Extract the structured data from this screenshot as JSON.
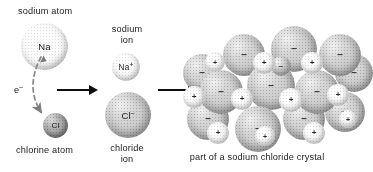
{
  "figure": {
    "type": "chemistry-process-diagram"
  },
  "labels": {
    "sodium_atom": "sodium atom",
    "chlorine_atom": "chlorine atom",
    "sodium_ion_line1": "sodium",
    "sodium_ion_line2": "ion",
    "chloride_ion_line1": "chloride",
    "chloride_ion_line2": "ion",
    "crystal_caption": "part of a sodium chloride crystal",
    "electron": "e",
    "electron_charge": "–"
  },
  "species": {
    "na_atom": {
      "symbol": "Na",
      "charge": "",
      "shade": "light"
    },
    "cl_atom": {
      "symbol": "Cl",
      "charge": "",
      "shade": "dark"
    },
    "na_ion": {
      "symbol": "Na",
      "charge": "+",
      "shade": "light"
    },
    "cl_ion": {
      "symbol": "Cl",
      "charge": "–",
      "shade": "mid"
    }
  },
  "arrows": {
    "arrow1_name": "reaction-arrow-1",
    "arrow2_name": "reaction-arrow-2",
    "electron_arrow_name": "electron-transfer-arrow"
  },
  "crystal": {
    "anion_glyph": "–",
    "cation_glyph": "+",
    "anion_count": 13,
    "cation_count": 11,
    "anions": [
      {
        "x": 40,
        "y": 8,
        "d": 42,
        "z": 1
      },
      {
        "x": 88,
        "y": 0,
        "d": 46,
        "z": 1
      },
      {
        "x": 136,
        "y": 8,
        "d": 42,
        "z": 1
      },
      {
        "x": 16,
        "y": 44,
        "d": 44,
        "z": 3
      },
      {
        "x": 64,
        "y": 36,
        "d": 48,
        "z": 4
      },
      {
        "x": 112,
        "y": 44,
        "d": 44,
        "z": 3
      },
      {
        "x": 0,
        "y": 28,
        "d": 38,
        "z": 0
      },
      {
        "x": 152,
        "y": 28,
        "d": 38,
        "z": 0
      },
      {
        "x": 4,
        "y": 72,
        "d": 42,
        "z": 2
      },
      {
        "x": 52,
        "y": 80,
        "d": 46,
        "z": 5
      },
      {
        "x": 100,
        "y": 72,
        "d": 42,
        "z": 2
      },
      {
        "x": 142,
        "y": 66,
        "d": 40,
        "z": 1
      },
      {
        "x": 88,
        "y": 30,
        "d": 20,
        "z": 6
      }
    ],
    "cations": [
      {
        "x": 70,
        "y": 26,
        "d": 22,
        "z": 6
      },
      {
        "x": 118,
        "y": 26,
        "d": 22,
        "z": 6
      },
      {
        "x": 22,
        "y": 26,
        "d": 20,
        "z": 2
      },
      {
        "x": 0,
        "y": 60,
        "d": 22,
        "z": 4
      },
      {
        "x": 48,
        "y": 62,
        "d": 22,
        "z": 5
      },
      {
        "x": 96,
        "y": 62,
        "d": 24,
        "z": 7
      },
      {
        "x": 144,
        "y": 58,
        "d": 22,
        "z": 4
      },
      {
        "x": 24,
        "y": 96,
        "d": 22,
        "z": 6
      },
      {
        "x": 72,
        "y": 100,
        "d": 20,
        "z": 5
      },
      {
        "x": 120,
        "y": 96,
        "d": 22,
        "z": 6
      },
      {
        "x": 156,
        "y": 84,
        "d": 18,
        "z": 3
      }
    ]
  }
}
